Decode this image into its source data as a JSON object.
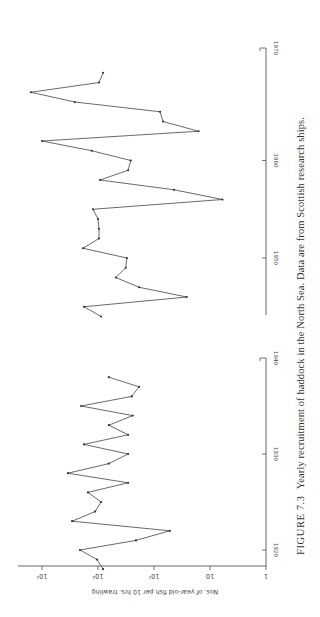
{
  "chart_data": {
    "type": "line",
    "xlabel": "Year",
    "ylabel": "Nos. of year-old fish per 10 hrs. trawling",
    "yscale": "log",
    "ylim": [
      1,
      10000
    ],
    "y_ticks": [
      {
        "value": 1,
        "label": "1"
      },
      {
        "value": 10,
        "label": "10"
      },
      {
        "value": 100,
        "label": "10²"
      },
      {
        "value": 1000,
        "label": "10³"
      },
      {
        "value": 10000,
        "label": "10⁴"
      }
    ],
    "x_ticks": [
      1920,
      1930,
      1940,
      1950,
      1960,
      1970
    ],
    "orientation": "rotated 90° — years run bottom-to-top, values increase right-to-left",
    "grid": false,
    "series": [
      {
        "name": "1918–1938",
        "x": [
          1918,
          1919,
          1920,
          1921,
          1922,
          1923,
          1924,
          1925,
          1926,
          1927,
          1928,
          1929,
          1930,
          1931,
          1932,
          1933,
          1934,
          1935,
          1936,
          1937,
          1938
        ],
        "values": [
          810,
          1040,
          2100,
          210,
          52,
          2900,
          1130,
          880,
          1510,
          290,
          3440,
          640,
          290,
          1780,
          290,
          640,
          240,
          2000,
          250,
          185,
          640
        ]
      },
      {
        "name": "1944–1969",
        "x": [
          1944,
          1945,
          1946,
          1947,
          1948,
          1949,
          1950,
          1951,
          1952,
          1953,
          1954,
          1955,
          1956,
          1957,
          1958,
          1959,
          1960,
          1961,
          1962,
          1963,
          1964,
          1965,
          1966,
          1967,
          1968,
          1969
        ],
        "values": [
          880,
          1780,
          26,
          185,
          480,
          320,
          305,
          1850,
          960,
          960,
          1000,
          1230,
          6,
          44,
          920,
          290,
          260,
          1290,
          10000,
          16,
          69,
          78,
          2600,
          15800,
          960,
          810
        ]
      }
    ]
  },
  "caption": {
    "figure": "FIGURE 7.3",
    "text": "Yearly recruitment of haddock in the North Sea. Data are from Scottish research ships."
  },
  "axis": {
    "ylabel": "Nos. of year-old fish per 10 hrs. trawling"
  }
}
